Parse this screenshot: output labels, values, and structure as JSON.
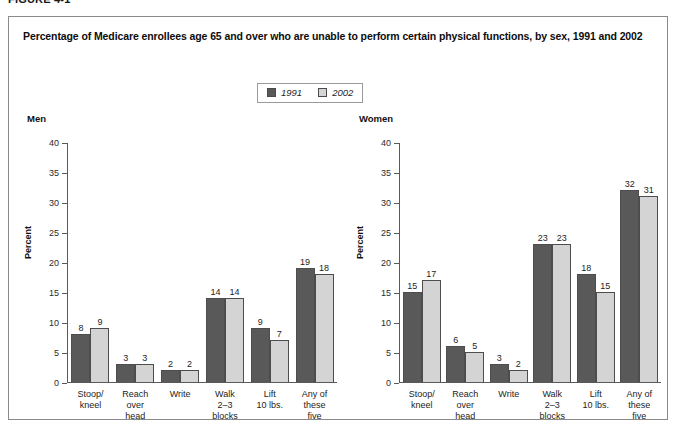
{
  "figure": {
    "label": "FIGURE 4-1"
  },
  "panel": {
    "title": "Percentage of Medicare enrollees age 65 and over who are unable to perform certain physical functions, by sex, 1991 and 2002"
  },
  "legend": {
    "position": "top-center",
    "entries": [
      {
        "label": "1991",
        "color": "#595959",
        "swatch": "legend-swatch-1991"
      },
      {
        "label": "2002",
        "color": "#d4d4d4",
        "swatch": "legend-swatch-2002"
      }
    ]
  },
  "chart_data": [
    {
      "type": "bar",
      "title": "Men",
      "xlabel": "",
      "ylabel": "Percent",
      "ylim": [
        0,
        40
      ],
      "yticks": [
        0,
        5,
        10,
        15,
        20,
        25,
        30,
        35,
        40
      ],
      "grid": false,
      "categories": [
        "Stoop/\nkneel",
        "Reach\nover\nhead",
        "Write",
        "Walk\n2–3\nblocks",
        "Lift\n10 lbs.",
        "Any of\nthese\nfive"
      ],
      "series": [
        {
          "name": "1991",
          "color": "#595959",
          "values": [
            8,
            3,
            2,
            14,
            9,
            19
          ]
        },
        {
          "name": "2002",
          "color": "#d4d4d4",
          "values": [
            9,
            3,
            2,
            14,
            7,
            18
          ]
        }
      ]
    },
    {
      "type": "bar",
      "title": "Women",
      "xlabel": "",
      "ylabel": "Percent",
      "ylim": [
        0,
        40
      ],
      "yticks": [
        0,
        5,
        10,
        15,
        20,
        25,
        30,
        35,
        40
      ],
      "grid": false,
      "categories": [
        "Stoop/\nkneel",
        "Reach\nover\nhead",
        "Write",
        "Walk\n2–3\nblocks",
        "Lift\n10 lbs.",
        "Any of\nthese\nfive"
      ],
      "series": [
        {
          "name": "1991",
          "color": "#595959",
          "values": [
            15,
            6,
            3,
            23,
            18,
            32
          ]
        },
        {
          "name": "2002",
          "color": "#d4d4d4",
          "values": [
            17,
            5,
            2,
            23,
            15,
            31
          ]
        }
      ]
    }
  ]
}
